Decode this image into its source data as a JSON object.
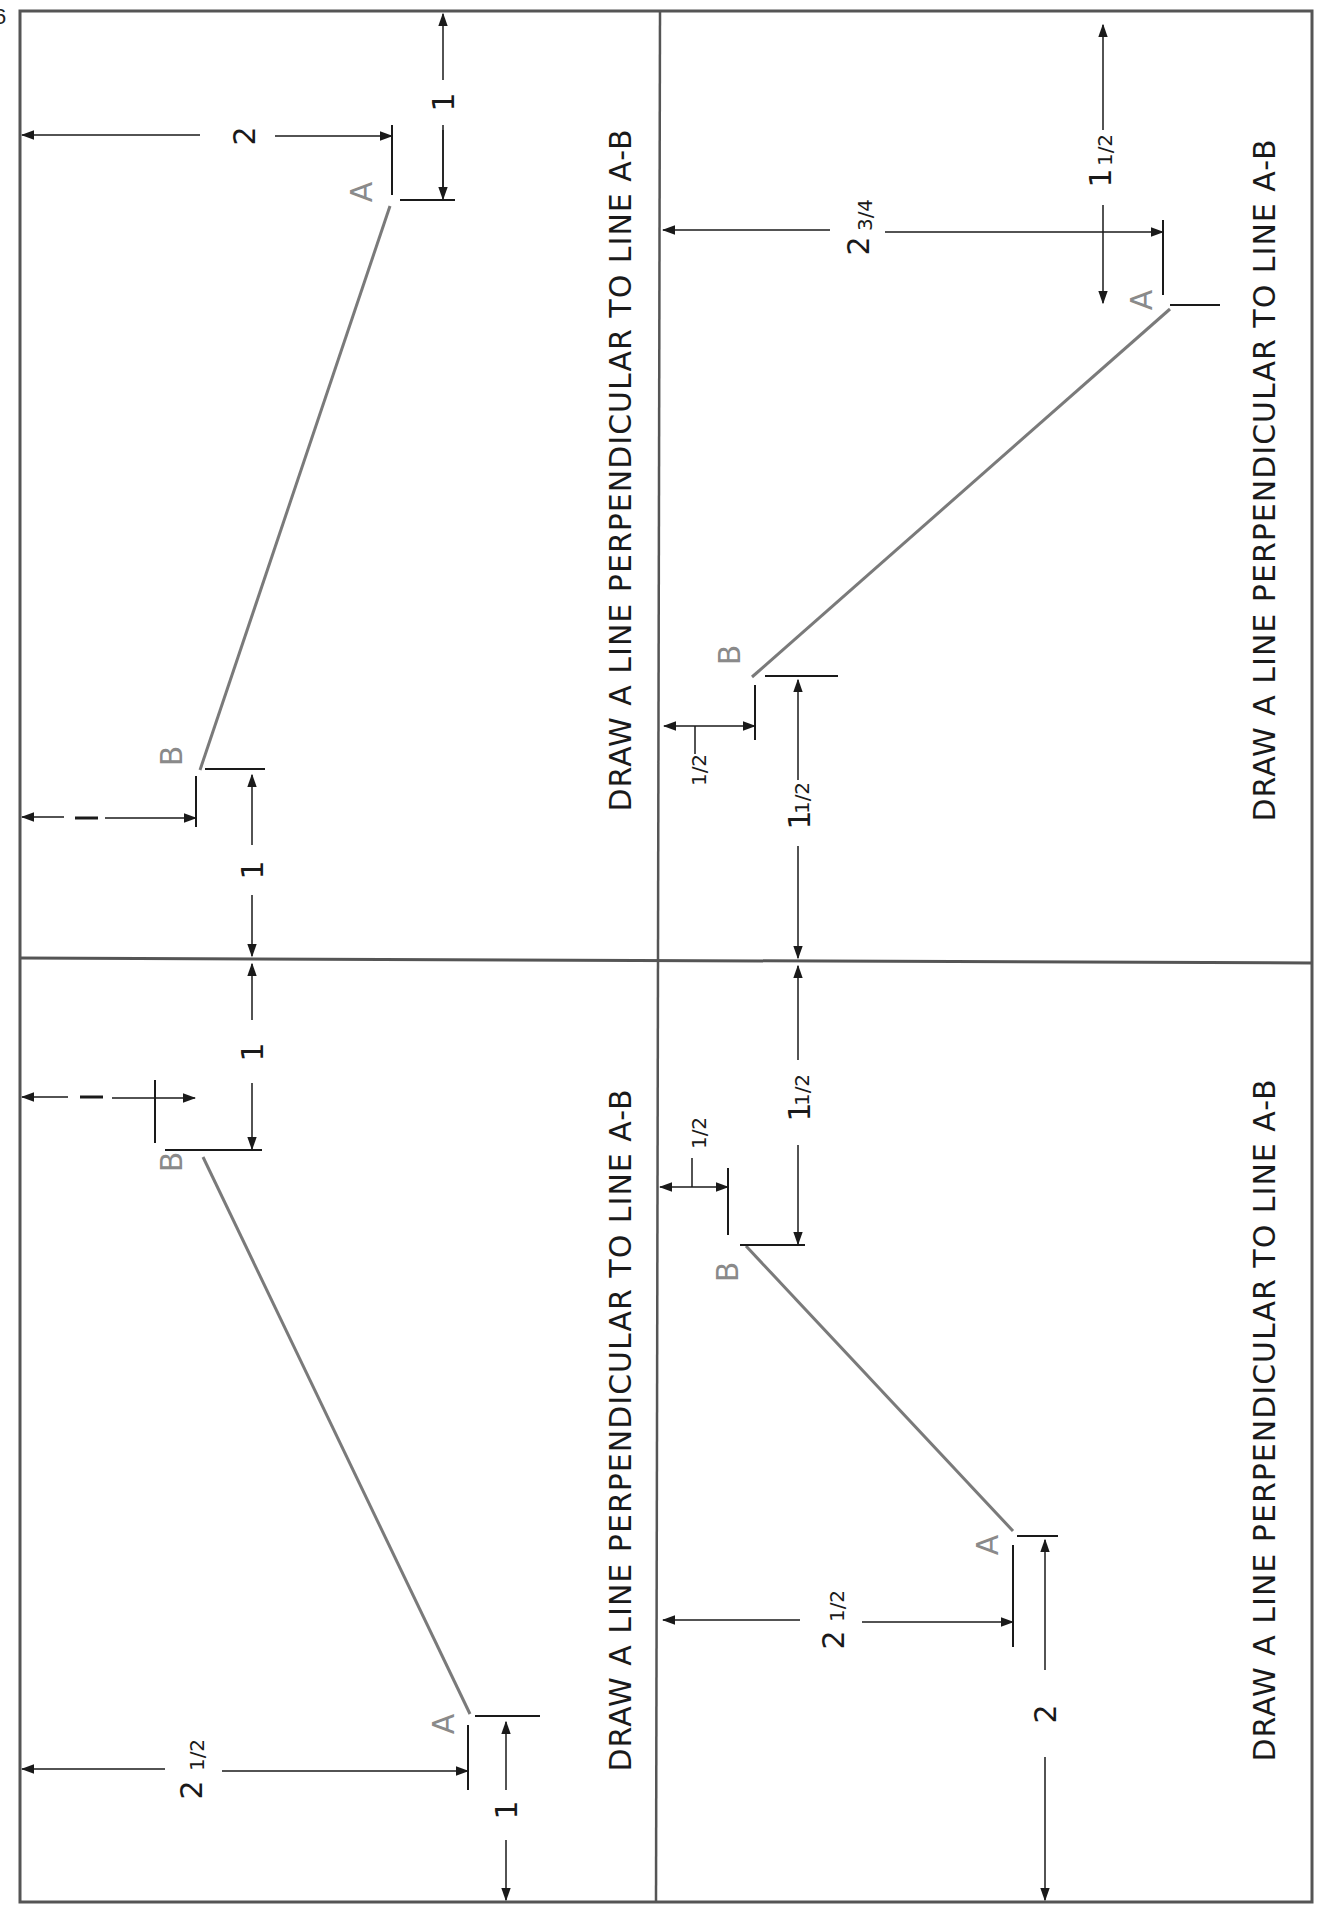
{
  "page": {
    "number": "6",
    "orientation": "rotated-90-ccw",
    "colors": {
      "border": "#555555",
      "ink": "#1a1a1a",
      "line_ab": "#7a7a7a",
      "point_label": "#8a8a8a"
    }
  },
  "panels": [
    {
      "id": "panel-1",
      "position": "top-left",
      "instruction": "DRAW A LINE PERPENDICULAR TO LINE A-B",
      "point_a_label": "A",
      "point_b_label": "B",
      "dims": {
        "a_from_left": "2",
        "a_from_top": "1",
        "b_from_left": "—",
        "b_from_divider": "1"
      }
    },
    {
      "id": "panel-2",
      "position": "bottom-left",
      "instruction": "DRAW A LINE PERPENDICULAR TO LINE A-B",
      "point_a_label": "A",
      "point_b_label": "B",
      "dims": {
        "b_from_left": "—",
        "b_from_divider": "1",
        "a_from_left_whole": "2",
        "a_from_left_frac": "1/2",
        "a_from_bottom": "1"
      }
    },
    {
      "id": "panel-3",
      "position": "top-right",
      "instruction": "DRAW A LINE PERPENDICULAR TO LINE A-B",
      "point_a_label": "A",
      "point_b_label": "B",
      "dims": {
        "a_from_left_whole": "2",
        "a_from_left_frac": "3/4",
        "a_from_top_whole": "1",
        "a_from_top_frac": "1/2",
        "b_from_left_frac": "1/2",
        "b_from_divider_whole": "1",
        "b_from_divider_frac": "1/2"
      }
    },
    {
      "id": "panel-4",
      "position": "bottom-right",
      "instruction": "DRAW A LINE PERPENDICULAR TO LINE A-B",
      "point_a_label": "A",
      "point_b_label": "B",
      "dims": {
        "b_from_divider_whole": "1",
        "b_from_divider_frac": "1/2",
        "b_from_left_frac": "1/2",
        "a_from_left_whole": "2",
        "a_from_left_frac": "1/2",
        "a_from_bottom": "2"
      }
    }
  ]
}
